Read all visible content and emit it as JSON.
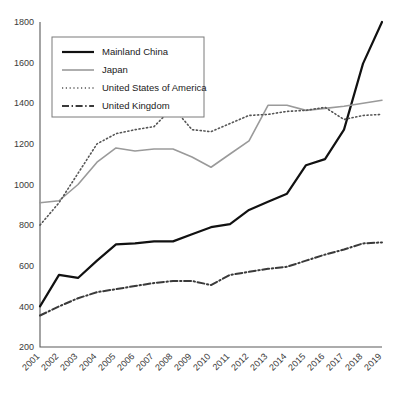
{
  "chart_data": {
    "type": "line",
    "title": "",
    "subtitle": "",
    "xlabel": "",
    "ylabel": "",
    "grid": false,
    "legend_position": "top-left",
    "xlim": [
      2001,
      2019
    ],
    "ylim": [
      200,
      1800
    ],
    "ytick_step": 200,
    "yticks": [
      200,
      400,
      600,
      800,
      1000,
      1200,
      1400,
      1600,
      1800
    ],
    "ytick_labels": [
      "200",
      "400",
      "600",
      "800",
      "1000",
      "1200",
      "1400",
      "1600",
      "1800"
    ],
    "categories": [
      2001,
      2002,
      2003,
      2004,
      2005,
      2006,
      2007,
      2008,
      2009,
      2010,
      2011,
      2012,
      2013,
      2014,
      2015,
      2016,
      2017,
      2018,
      2019
    ],
    "xtick_labels": [
      "2001",
      "2002",
      "2003",
      "2004",
      "2005",
      "2006",
      "2007",
      "2008",
      "2009",
      "2010",
      "2011",
      "2012",
      "2013",
      "2014",
      "2015",
      "2016",
      "2017",
      "2018",
      "2019"
    ],
    "series": [
      {
        "name": "Mainland China",
        "color": "#111111",
        "style": "solid",
        "width": 2.2,
        "values": [
          400,
          555,
          540,
          625,
          705,
          710,
          720,
          720,
          755,
          790,
          805,
          875,
          915,
          955,
          1095,
          1125,
          1270,
          1595,
          1800
        ]
      },
      {
        "name": "Japan",
        "color": "#9a9a9a",
        "style": "solid",
        "width": 1.6,
        "values": [
          910,
          920,
          1000,
          1110,
          1180,
          1165,
          1175,
          1175,
          1135,
          1085,
          1150,
          1215,
          1390,
          1390,
          1365,
          1375,
          1385,
          1400,
          1415
        ]
      },
      {
        "name": "United States of America",
        "color": "#555555",
        "style": "dotted",
        "width": 1.6,
        "values": [
          800,
          910,
          1055,
          1200,
          1250,
          1270,
          1285,
          1380,
          1270,
          1260,
          1300,
          1340,
          1345,
          1360,
          1365,
          1380,
          1320,
          1340,
          1345
        ]
      },
      {
        "name": "United Kingdom",
        "color": "#3a3a3a",
        "style": "dashdot",
        "width": 2.0,
        "values": [
          355,
          400,
          440,
          470,
          485,
          500,
          515,
          525,
          525,
          505,
          555,
          570,
          585,
          595,
          625,
          655,
          680,
          710,
          715
        ]
      }
    ]
  },
  "legend": {
    "items": [
      {
        "label": "Mainland China"
      },
      {
        "label": "Japan"
      },
      {
        "label": "United States of America"
      },
      {
        "label": "United Kingdom"
      }
    ]
  }
}
